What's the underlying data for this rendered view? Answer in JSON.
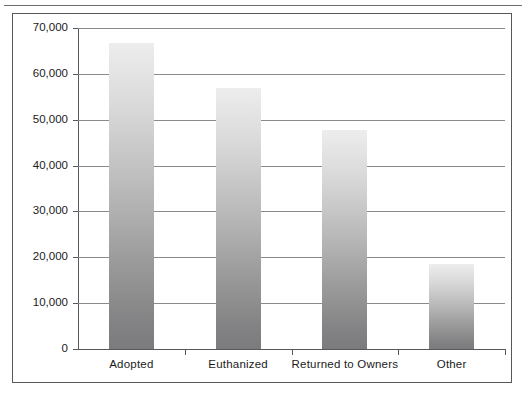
{
  "chart_data": {
    "type": "bar",
    "title": "",
    "subtitle": "",
    "xlabel": "",
    "ylabel": "",
    "categories": [
      "Adopted",
      "Euthanized",
      "Returned to Owners",
      "Other"
    ],
    "values": [
      66700,
      56900,
      47700,
      18500
    ],
    "ylim": [
      0,
      70000
    ],
    "yticks": [
      0,
      10000,
      20000,
      30000,
      40000,
      50000,
      60000,
      70000
    ],
    "ytick_labels": [
      "0",
      "10,000",
      "20,000",
      "30,000",
      "40,000",
      "50,000",
      "60,000",
      "70,000"
    ],
    "grid": true,
    "grid_axis": "y",
    "legend": null,
    "legend_position": "none",
    "bar_fill": "vertical-gradient-light-to-gray",
    "bar_color_top": "#ededed",
    "bar_color_bottom": "#7b7b7d",
    "axis_color": "#58585a",
    "gridline_color": "#8a8a8c",
    "text_color": "#1b1b1b",
    "background": "#ffffff",
    "frame_border_color": "#58585a"
  },
  "figure": {
    "frame_label": "chart-frame",
    "top_rule_label": "page-rule"
  }
}
